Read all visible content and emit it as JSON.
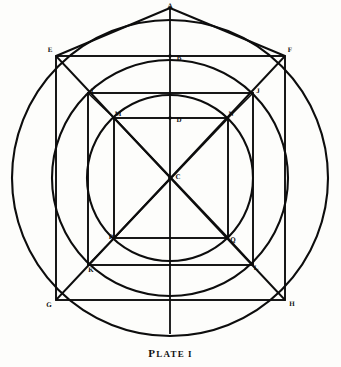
{
  "figure": {
    "caption_lead": "P",
    "caption_rest": "LATE",
    "caption_number": "I",
    "ink_color": "#0d0d0d",
    "background_color": "#fdfdfb"
  },
  "geometry": {
    "center": {
      "x": 170,
      "y": 178
    },
    "circles": [
      {
        "name": "outer-circle",
        "cx": 170,
        "cy": 178,
        "r": 158
      },
      {
        "name": "middle-circle",
        "cx": 170,
        "cy": 178,
        "r": 118
      },
      {
        "name": "inner-circle",
        "cx": 170,
        "cy": 178,
        "r": 83
      }
    ],
    "squares": [
      {
        "name": "outer-square",
        "left": 56,
        "top": 56,
        "right": 285,
        "bottom": 300
      },
      {
        "name": "middle-square",
        "left": 88,
        "top": 93,
        "right": 253,
        "bottom": 265
      },
      {
        "name": "inner-square",
        "left": 114,
        "top": 118,
        "right": 228,
        "bottom": 238
      }
    ],
    "vertical_axis": {
      "x": 170,
      "y_top": 8,
      "y_bottom": 334
    },
    "apex": {
      "x": 170,
      "y": 8
    }
  },
  "labels": [
    {
      "id": "A",
      "text": "A",
      "x": 170,
      "y": 6
    },
    {
      "id": "B",
      "text": "B",
      "x": 179,
      "y": 58
    },
    {
      "id": "C",
      "text": "C",
      "x": 178,
      "y": 177
    },
    {
      "id": "D",
      "text": "D",
      "x": 179,
      "y": 120
    },
    {
      "id": "E",
      "text": "E",
      "x": 50,
      "y": 50
    },
    {
      "id": "F",
      "text": "F",
      "x": 290,
      "y": 50
    },
    {
      "id": "G",
      "text": "G",
      "x": 49,
      "y": 305
    },
    {
      "id": "H",
      "text": "H",
      "x": 292,
      "y": 304
    },
    {
      "id": "I",
      "text": "I",
      "x": 92,
      "y": 91
    },
    {
      "id": "J",
      "text": "J",
      "x": 258,
      "y": 91
    },
    {
      "id": "K",
      "text": "K",
      "x": 91,
      "y": 270
    },
    {
      "id": "L",
      "text": "L",
      "x": 256,
      "y": 268
    },
    {
      "id": "M",
      "text": "M",
      "x": 118,
      "y": 114
    },
    {
      "id": "N",
      "text": "N",
      "x": 231,
      "y": 114
    },
    {
      "id": "P",
      "text": "P",
      "x": 111,
      "y": 237
    },
    {
      "id": "Q",
      "text": "Q",
      "x": 233,
      "y": 240
    }
  ]
}
